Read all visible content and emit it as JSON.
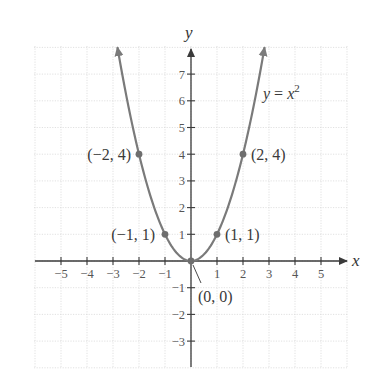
{
  "chart_data": {
    "type": "line",
    "title": "",
    "function": "y = x^2",
    "legend_label": {
      "lhs": "y",
      "eq": " = ",
      "var": "x",
      "exp": "2"
    },
    "xlabel": "x",
    "ylabel": "y",
    "xlim": [
      -6,
      6
    ],
    "ylim": [
      -4,
      8
    ],
    "grid": true,
    "x_ticks": [
      -5,
      -4,
      -3,
      -2,
      -1,
      1,
      2,
      3,
      4,
      5
    ],
    "y_ticks": [
      -3,
      -2,
      -1,
      1,
      2,
      3,
      4,
      5,
      6,
      7
    ],
    "x_tick_labels": [
      "−5",
      "−4",
      "−3",
      "−2",
      "−1",
      "1",
      "2",
      "3",
      "4",
      "5"
    ],
    "y_tick_labels": [
      "−3",
      "−2",
      "−1",
      "1",
      "2",
      "3",
      "4",
      "5",
      "6",
      "7"
    ],
    "curve_domain": [
      -2.83,
      2.83
    ],
    "points": [
      {
        "x": -2,
        "y": 4,
        "label": "(−2, 4)"
      },
      {
        "x": -1,
        "y": 1,
        "label": "(−1, 1)"
      },
      {
        "x": 0,
        "y": 0,
        "label": "(0, 0)"
      },
      {
        "x": 1,
        "y": 1,
        "label": "(1, 1)"
      },
      {
        "x": 2,
        "y": 4,
        "label": "(2, 4)"
      }
    ],
    "colors": {
      "curve": "#7a7a7a",
      "axis": "#3a3a3a",
      "grid": "#d9d9d9",
      "text": "#3a3a3a"
    }
  }
}
